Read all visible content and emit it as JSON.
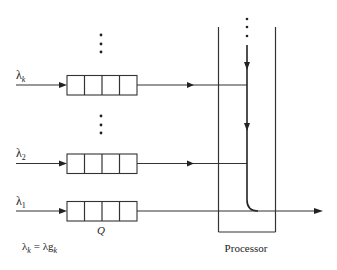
{
  "diagram": {
    "type": "multi-queue single processor",
    "queues": [
      {
        "id": "k",
        "input_label": "λ",
        "input_sub": "k",
        "y": 85
      },
      {
        "id": "2",
        "input_label": "λ",
        "input_sub": "2",
        "y": 164
      },
      {
        "id": "1",
        "input_label": "λ",
        "input_sub": "1",
        "y": 211
      }
    ],
    "queue_cells": 4,
    "queue_label": "Q",
    "ellipsis": "⋮",
    "formula": {
      "lhs": "λ",
      "lhs_sub": "k",
      "eq": " = ",
      "rhs": "λg",
      "rhs_sub": "k"
    },
    "processor_label": "Processor",
    "colors": {
      "stroke": "#333333",
      "background": "#ffffff"
    }
  }
}
